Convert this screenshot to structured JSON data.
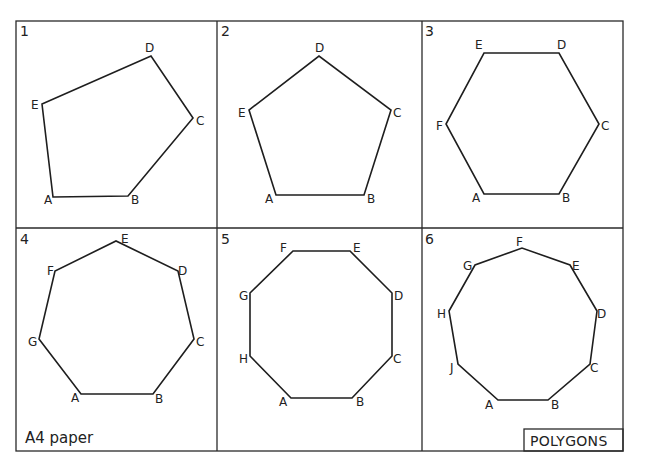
{
  "sheet": {
    "paper_label": "A4 paper",
    "title_block": "POLYGONS",
    "colors": {
      "line": "#1e1e1e",
      "background": "#ffffff"
    }
  },
  "panels": [
    {
      "number": "1",
      "shape": "irregular pentagon",
      "vertices": [
        {
          "label": "A",
          "x": 53,
          "y": 197,
          "lx": 44,
          "ly": 204
        },
        {
          "label": "B",
          "x": 128,
          "y": 196,
          "lx": 131,
          "ly": 204
        },
        {
          "label": "C",
          "x": 193,
          "y": 118,
          "lx": 196,
          "ly": 125
        },
        {
          "label": "D",
          "x": 151,
          "y": 56,
          "lx": 145,
          "ly": 52
        },
        {
          "label": "E",
          "x": 42,
          "y": 104,
          "lx": 31,
          "ly": 109
        }
      ]
    },
    {
      "number": "2",
      "shape": "regular pentagon",
      "vertices": [
        {
          "label": "A",
          "x": 276,
          "y": 195,
          "lx": 265,
          "ly": 203
        },
        {
          "label": "B",
          "x": 364,
          "y": 195,
          "lx": 367,
          "ly": 203
        },
        {
          "label": "C",
          "x": 391,
          "y": 110,
          "lx": 393,
          "ly": 117
        },
        {
          "label": "D",
          "x": 319,
          "y": 56,
          "lx": 315,
          "ly": 52
        },
        {
          "label": "E",
          "x": 249,
          "y": 110,
          "lx": 238,
          "ly": 117
        }
      ]
    },
    {
      "number": "3",
      "shape": "regular hexagon",
      "vertices": [
        {
          "label": "A",
          "x": 484,
          "y": 194,
          "lx": 472,
          "ly": 202
        },
        {
          "label": "B",
          "x": 559,
          "y": 194,
          "lx": 562,
          "ly": 202
        },
        {
          "label": "C",
          "x": 599,
          "y": 124,
          "lx": 601,
          "ly": 130
        },
        {
          "label": "D",
          "x": 559,
          "y": 53,
          "lx": 557,
          "ly": 49
        },
        {
          "label": "E",
          "x": 484,
          "y": 53,
          "lx": 475,
          "ly": 49
        },
        {
          "label": "F",
          "x": 446,
          "y": 124,
          "lx": 436,
          "ly": 130
        }
      ]
    },
    {
      "number": "4",
      "shape": "regular heptagon",
      "vertices": [
        {
          "label": "A",
          "x": 81,
          "y": 394,
          "lx": 71,
          "ly": 402
        },
        {
          "label": "B",
          "x": 153,
          "y": 394,
          "lx": 155,
          "ly": 403
        },
        {
          "label": "C",
          "x": 194,
          "y": 339,
          "lx": 196,
          "ly": 346
        },
        {
          "label": "D",
          "x": 178,
          "y": 271,
          "lx": 178,
          "ly": 275
        },
        {
          "label": "E",
          "x": 116,
          "y": 241,
          "lx": 121,
          "ly": 243
        },
        {
          "label": "F",
          "x": 55,
          "y": 271,
          "lx": 47,
          "ly": 275
        },
        {
          "label": "G",
          "x": 39,
          "y": 339,
          "lx": 28,
          "ly": 346
        }
      ]
    },
    {
      "number": "5",
      "shape": "regular octagon",
      "vertices": [
        {
          "label": "A",
          "x": 291,
          "y": 398,
          "lx": 279,
          "ly": 406
        },
        {
          "label": "B",
          "x": 352,
          "y": 398,
          "lx": 356,
          "ly": 406
        },
        {
          "label": "C",
          "x": 392,
          "y": 356,
          "lx": 393,
          "ly": 363
        },
        {
          "label": "D",
          "x": 392,
          "y": 293,
          "lx": 394,
          "ly": 300
        },
        {
          "label": "E",
          "x": 350,
          "y": 251,
          "lx": 353,
          "ly": 252
        },
        {
          "label": "F",
          "x": 293,
          "y": 251,
          "lx": 280,
          "ly": 252
        },
        {
          "label": "G",
          "x": 250,
          "y": 293,
          "lx": 239,
          "ly": 300
        },
        {
          "label": "H",
          "x": 250,
          "y": 356,
          "lx": 239,
          "ly": 363
        }
      ]
    },
    {
      "number": "6",
      "shape": "regular nonagon",
      "vertices": [
        {
          "label": "A",
          "x": 498,
          "y": 400,
          "lx": 485,
          "ly": 409
        },
        {
          "label": "B",
          "x": 548,
          "y": 400,
          "lx": 551,
          "ly": 409
        },
        {
          "label": "C",
          "x": 590,
          "y": 364,
          "lx": 590,
          "ly": 372
        },
        {
          "label": "D",
          "x": 597,
          "y": 311,
          "lx": 597,
          "ly": 318
        },
        {
          "label": "E",
          "x": 570,
          "y": 265,
          "lx": 572,
          "ly": 270
        },
        {
          "label": "F",
          "x": 522,
          "y": 248,
          "lx": 516,
          "ly": 246
        },
        {
          "label": "G",
          "x": 475,
          "y": 265,
          "lx": 463,
          "ly": 270
        },
        {
          "label": "H",
          "x": 449,
          "y": 311,
          "lx": 437,
          "ly": 318
        },
        {
          "label": "J",
          "x": 458,
          "y": 364,
          "lx": 450,
          "ly": 372
        }
      ]
    }
  ],
  "layout": {
    "frame": {
      "x": 16,
      "y": 21,
      "w": 607,
      "h": 430
    },
    "v_dividers": [
      217,
      422
    ],
    "h_divider": 228,
    "panel_origins": [
      [
        20,
        36
      ],
      [
        221,
        36
      ],
      [
        425,
        36
      ],
      [
        20,
        244
      ],
      [
        221,
        244
      ],
      [
        425,
        244
      ]
    ]
  }
}
